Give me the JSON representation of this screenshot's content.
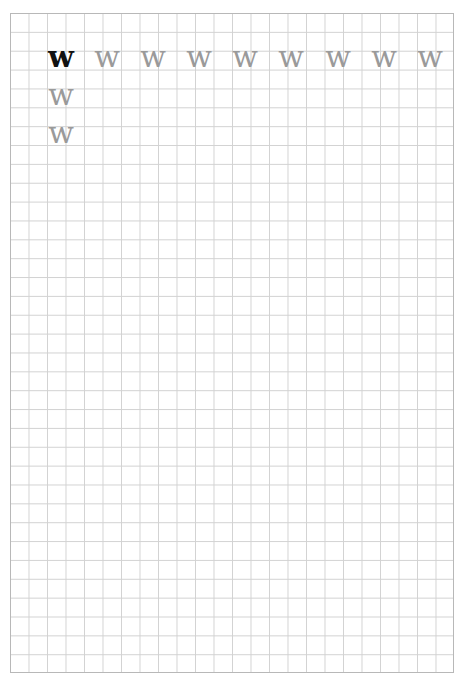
{
  "worksheet": {
    "letter": "w",
    "colors": {
      "model": "#111111",
      "trace": "#9a9a9a",
      "grid": "#d2d2d2",
      "border": "#b8b8b8"
    },
    "grid": {
      "columns": 24,
      "rows": 35
    },
    "row1": [
      "w",
      "w",
      "w",
      "w",
      "w",
      "w",
      "w",
      "w",
      "w"
    ],
    "column1": [
      "w",
      "w"
    ]
  }
}
